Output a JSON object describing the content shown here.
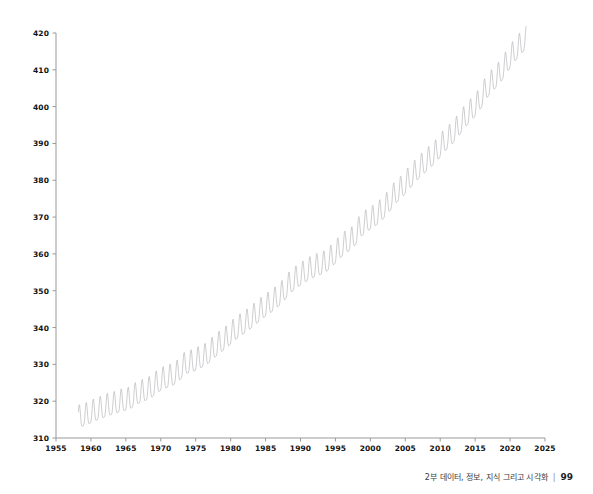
{
  "footer": {
    "caption": "2부 데이터, 정보, 지식 그리고 시각화",
    "separator": "|",
    "page_number": "99"
  },
  "chart_data": {
    "type": "line",
    "title": "",
    "subtitle": "",
    "xlabel": "",
    "ylabel": "",
    "xlim": [
      1955,
      2025
    ],
    "ylim": [
      310,
      420
    ],
    "xticks": [
      1955,
      1960,
      1965,
      1970,
      1975,
      1980,
      1985,
      1990,
      1995,
      2000,
      2005,
      2010,
      2015,
      2020,
      2025
    ],
    "yticks": [
      310,
      320,
      330,
      340,
      350,
      360,
      370,
      380,
      390,
      400,
      410,
      420
    ],
    "xtick_labels": [
      "1955",
      "1960",
      "1965",
      "1970",
      "1975",
      "1980",
      "1985",
      "1990",
      "1995",
      "2000",
      "2005",
      "2010",
      "2015",
      "2020",
      "2025"
    ],
    "ytick_labels": [
      "310",
      "320",
      "330",
      "340",
      "350",
      "360",
      "370",
      "380",
      "390",
      "400",
      "410",
      "420"
    ],
    "grid": false,
    "legend": "none",
    "spines": [
      "left",
      "bottom"
    ],
    "tick_direction": "out",
    "line_color": "#b9b9bd",
    "line_width": 0.7,
    "series": [
      {
        "name": "Mauna Loa atmospheric CO2 (ppm, monthly)",
        "x_start": 1958.2,
        "x_end": 2022.3,
        "sample_interval_years": 0.08333,
        "seasonal_amplitude_ppm": 3.1,
        "seasonal_peak_month": 5,
        "trend_annual": [
          {
            "year": 1958,
            "value": 315.3
          },
          {
            "year": 1959,
            "value": 315.9
          },
          {
            "year": 1960,
            "value": 316.9
          },
          {
            "year": 1961,
            "value": 317.6
          },
          {
            "year": 1962,
            "value": 318.4
          },
          {
            "year": 1963,
            "value": 318.9
          },
          {
            "year": 1964,
            "value": 319.6
          },
          {
            "year": 1965,
            "value": 320.0
          },
          {
            "year": 1966,
            "value": 321.4
          },
          {
            "year": 1967,
            "value": 322.2
          },
          {
            "year": 1968,
            "value": 323.0
          },
          {
            "year": 1969,
            "value": 324.6
          },
          {
            "year": 1970,
            "value": 325.7
          },
          {
            "year": 1971,
            "value": 326.3
          },
          {
            "year": 1972,
            "value": 327.5
          },
          {
            "year": 1973,
            "value": 329.7
          },
          {
            "year": 1974,
            "value": 330.2
          },
          {
            "year": 1975,
            "value": 331.1
          },
          {
            "year": 1976,
            "value": 332.0
          },
          {
            "year": 1977,
            "value": 333.8
          },
          {
            "year": 1978,
            "value": 335.4
          },
          {
            "year": 1979,
            "value": 336.8
          },
          {
            "year": 1980,
            "value": 338.7
          },
          {
            "year": 1981,
            "value": 340.1
          },
          {
            "year": 1982,
            "value": 341.4
          },
          {
            "year": 1983,
            "value": 343.0
          },
          {
            "year": 1984,
            "value": 344.6
          },
          {
            "year": 1985,
            "value": 346.0
          },
          {
            "year": 1986,
            "value": 347.4
          },
          {
            "year": 1987,
            "value": 349.2
          },
          {
            "year": 1988,
            "value": 351.6
          },
          {
            "year": 1989,
            "value": 353.1
          },
          {
            "year": 1990,
            "value": 354.4
          },
          {
            "year": 1991,
            "value": 355.6
          },
          {
            "year": 1992,
            "value": 356.4
          },
          {
            "year": 1993,
            "value": 357.1
          },
          {
            "year": 1994,
            "value": 358.8
          },
          {
            "year": 1995,
            "value": 360.8
          },
          {
            "year": 1996,
            "value": 362.6
          },
          {
            "year": 1997,
            "value": 363.7
          },
          {
            "year": 1998,
            "value": 366.7
          },
          {
            "year": 1999,
            "value": 368.4
          },
          {
            "year": 2000,
            "value": 369.5
          },
          {
            "year": 2001,
            "value": 371.1
          },
          {
            "year": 2002,
            "value": 373.2
          },
          {
            "year": 2003,
            "value": 375.8
          },
          {
            "year": 2004,
            "value": 377.5
          },
          {
            "year": 2005,
            "value": 379.8
          },
          {
            "year": 2006,
            "value": 381.9
          },
          {
            "year": 2007,
            "value": 383.8
          },
          {
            "year": 2008,
            "value": 385.6
          },
          {
            "year": 2009,
            "value": 387.4
          },
          {
            "year": 2010,
            "value": 389.9
          },
          {
            "year": 2011,
            "value": 391.6
          },
          {
            "year": 2012,
            "value": 393.9
          },
          {
            "year": 2013,
            "value": 396.5
          },
          {
            "year": 2014,
            "value": 398.6
          },
          {
            "year": 2015,
            "value": 400.8
          },
          {
            "year": 2016,
            "value": 404.2
          },
          {
            "year": 2017,
            "value": 406.5
          },
          {
            "year": 2018,
            "value": 408.5
          },
          {
            "year": 2019,
            "value": 411.4
          },
          {
            "year": 2020,
            "value": 414.2
          },
          {
            "year": 2021,
            "value": 416.4
          },
          {
            "year": 2022,
            "value": 418.6
          }
        ]
      }
    ]
  }
}
